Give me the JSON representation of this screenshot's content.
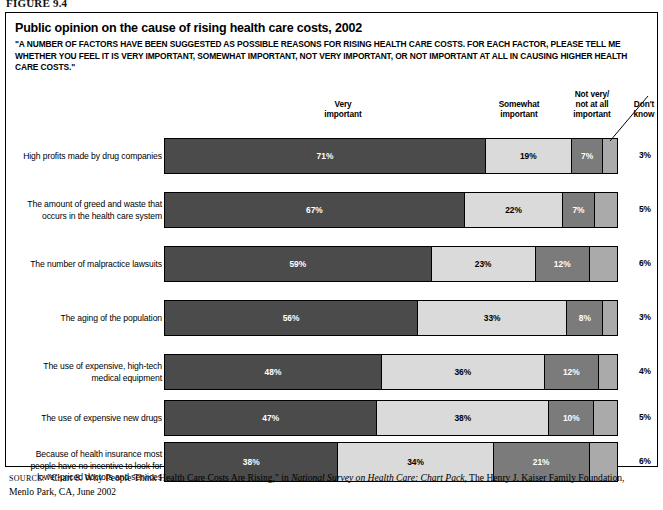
{
  "figure_label": "FIGURE 9.4",
  "title": "Public opinion on the cause of rising health care costs, 2002",
  "subtitle": "\"A NUMBER OF FACTORS HAVE BEEN SUGGESTED AS POSSIBLE REASONS FOR RISING HEALTH CARE COSTS. FOR EACH FACTOR, PLEASE TELL ME WHETHER YOU FEEL IT IS VERY IMPORTANT, SOMEWHAT IMPORTANT, NOT VERY IMPORTANT, OR NOT IMPORTANT AT ALL IN CAUSING HIGHER HEALTH CARE COSTS.\"",
  "headers": {
    "very": "Very\nimportant",
    "somewhat": "Somewhat\nimportant",
    "not_very": "Not very/\nnot at all\nimportant",
    "dont_know": "Don't\nknow"
  },
  "source": {
    "prefix": "SOURCE:",
    "text_before_italic": " \"Chart 8. Why People Think Health Care Costs Are Rising,\" in ",
    "italic": "National Survey on Health Care: Chart Pack",
    "text_after_italic": ", The Henry J. Kaiser Family Foundation, Menlo Park, CA, June 2002"
  },
  "colors": {
    "very_important": "#4b4b4b",
    "somewhat_important": "#dadada",
    "not_very_important": "#7b7b7b",
    "dont_know": "#aaaaaa",
    "outline": "#000000"
  },
  "chart_data": {
    "type": "bar",
    "subtype": "stacked-horizontal-100pct",
    "title": "Public opinion on the cause of rising health care costs, 2002",
    "xlabel": "",
    "ylabel": "",
    "xlim": [
      0,
      100
    ],
    "grid": false,
    "legend_position": "top",
    "units": "percent",
    "series": [
      {
        "name": "Very important",
        "values": [
          71,
          67,
          59,
          56,
          48,
          47,
          38
        ]
      },
      {
        "name": "Somewhat important",
        "values": [
          19,
          22,
          23,
          33,
          36,
          38,
          34
        ]
      },
      {
        "name": "Not very/not at all important",
        "values": [
          7,
          7,
          12,
          8,
          12,
          10,
          21
        ]
      },
      {
        "name": "Don't know",
        "values": [
          3,
          5,
          6,
          3,
          4,
          5,
          6
        ]
      }
    ],
    "categories": [
      "High profits made by drug companies",
      "The amount of greed and waste that occurs in the health care system",
      "The number of malpractice lawsuits",
      "The aging of the population",
      "The use of expensive, high-tech medical equipment",
      "The use of expensive new drugs",
      "Because of health insurance most people have no incentive to look for lower-priced doctors and services"
    ]
  },
  "rows": [
    {
      "label_lines": [
        "High profits made by drug companies"
      ],
      "segments": [
        {
          "value": 71,
          "label": "71%",
          "show": true
        },
        {
          "value": 19,
          "label": "19%",
          "show": true
        },
        {
          "value": 7,
          "label": "7%",
          "show": true
        },
        {
          "value": 3,
          "label": "",
          "show": false
        }
      ],
      "dont_know": "3%"
    },
    {
      "label_lines": [
        "The amount of greed and waste that",
        "occurs in the health care system"
      ],
      "segments": [
        {
          "value": 67,
          "label": "67%",
          "show": true
        },
        {
          "value": 22,
          "label": "22%",
          "show": true
        },
        {
          "value": 7,
          "label": "7%",
          "show": true
        },
        {
          "value": 5,
          "label": "",
          "show": false
        }
      ],
      "dont_know": "5%"
    },
    {
      "label_lines": [
        "The number of malpractice lawsuits"
      ],
      "segments": [
        {
          "value": 59,
          "label": "59%",
          "show": true
        },
        {
          "value": 23,
          "label": "23%",
          "show": true
        },
        {
          "value": 12,
          "label": "12%",
          "show": true
        },
        {
          "value": 6,
          "label": "",
          "show": false
        }
      ],
      "dont_know": "6%"
    },
    {
      "label_lines": [
        "The aging of the population"
      ],
      "segments": [
        {
          "value": 56,
          "label": "56%",
          "show": true
        },
        {
          "value": 33,
          "label": "33%",
          "show": true
        },
        {
          "value": 8,
          "label": "8%",
          "show": true
        },
        {
          "value": 3,
          "label": "",
          "show": false
        }
      ],
      "dont_know": "3%"
    },
    {
      "label_lines": [
        "The use of expensive, high-tech",
        "medical equipment"
      ],
      "segments": [
        {
          "value": 48,
          "label": "48%",
          "show": true
        },
        {
          "value": 36,
          "label": "36%",
          "show": true
        },
        {
          "value": 12,
          "label": "12%",
          "show": true
        },
        {
          "value": 4,
          "label": "",
          "show": false
        }
      ],
      "dont_know": "4%"
    },
    {
      "label_lines": [
        "The use of expensive new drugs"
      ],
      "segments": [
        {
          "value": 47,
          "label": "47%",
          "show": true
        },
        {
          "value": 38,
          "label": "38%",
          "show": true
        },
        {
          "value": 10,
          "label": "10%",
          "show": true
        },
        {
          "value": 5,
          "label": "",
          "show": false
        }
      ],
      "dont_know": "5%"
    },
    {
      "label_lines": [
        "Because of health insurance most",
        "people have no incentive to look for",
        "lower-priced doctors and services"
      ],
      "segments": [
        {
          "value": 38,
          "label": "38%",
          "show": true
        },
        {
          "value": 34,
          "label": "34%",
          "show": true
        },
        {
          "value": 21,
          "label": "21%",
          "show": true
        },
        {
          "value": 6,
          "label": "",
          "show": false
        }
      ],
      "dont_know": "6%"
    }
  ]
}
